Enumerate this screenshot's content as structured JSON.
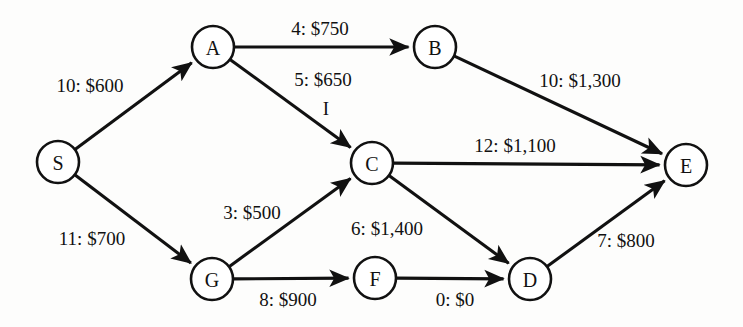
{
  "diagram": {
    "background_color": "#fdfdfc",
    "ink_color": "#111111",
    "nodes": [
      {
        "id": "S",
        "label": "S",
        "x": 58,
        "y": 162,
        "r": 21
      },
      {
        "id": "A",
        "label": "A",
        "x": 213,
        "y": 47,
        "r": 21
      },
      {
        "id": "B",
        "label": "B",
        "x": 435,
        "y": 47,
        "r": 21
      },
      {
        "id": "C",
        "label": "C",
        "x": 372,
        "y": 163,
        "r": 21
      },
      {
        "id": "D",
        "label": "D",
        "x": 530,
        "y": 279,
        "r": 21
      },
      {
        "id": "E",
        "label": "E",
        "x": 686,
        "y": 165,
        "r": 21
      },
      {
        "id": "F",
        "label": "F",
        "x": 375,
        "y": 278,
        "r": 21
      },
      {
        "id": "G",
        "label": "G",
        "x": 212,
        "y": 279,
        "r": 21
      }
    ],
    "edges": [
      {
        "id": "S-A",
        "from": "S",
        "to": "A",
        "label": "10: $600",
        "capacity": 10,
        "cost": 600,
        "label_x": 90,
        "label_y": 85
      },
      {
        "id": "S-G",
        "from": "S",
        "to": "G",
        "label": "11: $700",
        "capacity": 11,
        "cost": 700,
        "label_x": 92,
        "label_y": 238
      },
      {
        "id": "A-B",
        "from": "A",
        "to": "B",
        "label": "4: $750",
        "capacity": 4,
        "cost": 750,
        "label_x": 320,
        "label_y": 28
      },
      {
        "id": "A-C",
        "from": "A",
        "to": "C",
        "label": "5: $650",
        "capacity": 5,
        "cost": 650,
        "label_x": 323,
        "label_y": 79
      },
      {
        "id": "B-E",
        "from": "B",
        "to": "E",
        "label": "10: $1,300",
        "capacity": 10,
        "cost": 1300,
        "label_x": 580,
        "label_y": 80
      },
      {
        "id": "C-E",
        "from": "C",
        "to": "E",
        "label": "12: $1,100",
        "capacity": 12,
        "cost": 1100,
        "label_x": 515,
        "label_y": 145
      },
      {
        "id": "G-C",
        "from": "G",
        "to": "C",
        "label": "3: $500",
        "capacity": 3,
        "cost": 500,
        "label_x": 252,
        "label_y": 212
      },
      {
        "id": "C-D",
        "from": "C",
        "to": "D",
        "label": "6: $1,400",
        "capacity": 6,
        "cost": 1400,
        "label_x": 387,
        "label_y": 228
      },
      {
        "id": "G-F",
        "from": "G",
        "to": "F",
        "label": "8: $900",
        "capacity": 8,
        "cost": 900,
        "label_x": 288,
        "label_y": 299
      },
      {
        "id": "F-D",
        "from": "F",
        "to": "D",
        "label": "0: $0",
        "capacity": 0,
        "cost": 0,
        "label_x": 455,
        "label_y": 299
      },
      {
        "id": "D-E",
        "from": "D",
        "to": "E",
        "label": "7: $800",
        "capacity": 7,
        "cost": 800,
        "label_x": 626,
        "label_y": 240
      }
    ],
    "artifacts": [
      {
        "id": "tick-below-5-650",
        "mark": "I",
        "x": 326,
        "y": 108
      }
    ]
  }
}
